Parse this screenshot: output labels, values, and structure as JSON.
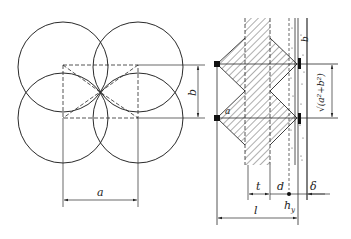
{
  "left_figure": {
    "description": "Four overlapping circles arranged in a square grid with dashed rectangle connecting centers",
    "labels": {
      "horizontal_spacing": "a",
      "vertical_spacing": "b"
    }
  },
  "right_figure": {
    "description": "Cross-section of hatched column with diamond-shaped zones and layered strip",
    "labels": {
      "angle": "a",
      "diagonal": "√(a²+b²)",
      "strip_label": "b",
      "thickness_t": "t",
      "distance_d": "d",
      "layer_delta": "δ",
      "total_length": "l",
      "point_label": "h",
      "point_subscript": "y"
    }
  },
  "colors": {
    "line": "#2a2a2a",
    "background": "#ffffff"
  }
}
